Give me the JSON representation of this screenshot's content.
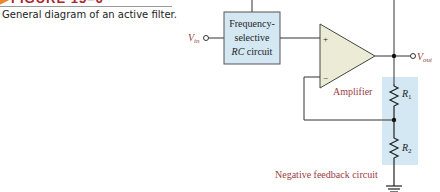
{
  "figure": {
    "label": "FIGURE 15–6",
    "caption": "General diagram of an active filter."
  },
  "diagram": {
    "input_label": "V",
    "input_sub": "in",
    "output_label": "V",
    "output_sub": "out",
    "filter_block": {
      "line1": "Frequency-",
      "line2": "selective",
      "line3_italic": "RC",
      "line3_rest": " circuit"
    },
    "amplifier": {
      "label": "Amplifier",
      "plus": "+",
      "minus": "−"
    },
    "resistors": [
      {
        "name": "R",
        "sub": "1"
      },
      {
        "name": "R",
        "sub": "2"
      }
    ],
    "feedback_label": "Negative feedback circuit",
    "colors": {
      "block_fill": "#d4e8f3",
      "feedback_fill": "#d4e8f3",
      "amp_fill": "#ecebd5",
      "label_red": "#9a3b3f",
      "wire": "#333333",
      "header_red": "#a8262e",
      "header_arrow": "#e8892a"
    }
  }
}
